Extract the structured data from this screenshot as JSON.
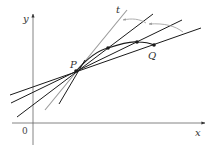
{
  "diagram": {
    "axes": {
      "x_label": "x",
      "y_label": "y",
      "origin_label": "0"
    },
    "points": {
      "P": "P",
      "Q": "Q"
    },
    "tangent_label": "t",
    "colors": {
      "axis": "#555555",
      "secant": "#1a1a1a",
      "tangent": "#999999",
      "arrow_arc": "#999999"
    }
  }
}
